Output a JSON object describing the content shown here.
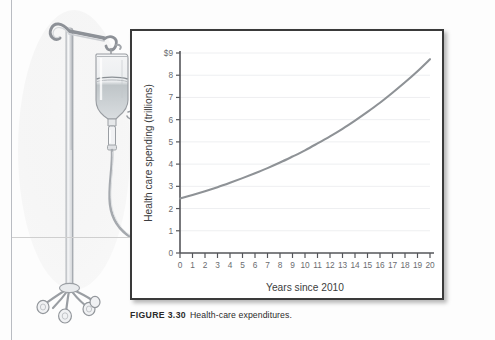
{
  "figure": {
    "caption_label": "FIGURE 3.30",
    "caption_text": "Health-care expenditures."
  },
  "illustration": {
    "name": "iv-drip-stand",
    "description": "Pencil sketch of a rolling IV stand with a fluid bag, drip chamber and tubing"
  },
  "chart_data": {
    "type": "line",
    "title": "",
    "subtitle": "",
    "xlabel": "Years since 2010",
    "ylabel": "Health care spending (trillions)",
    "xlim": [
      0,
      20
    ],
    "ylim": [
      0,
      9
    ],
    "grid": true,
    "legend": "none",
    "x_ticks": [
      "0",
      "1",
      "2",
      "3",
      "4",
      "5",
      "6",
      "7",
      "8",
      "9",
      "10",
      "11",
      "12",
      "13",
      "14",
      "15",
      "16",
      "17",
      "18",
      "19",
      "20"
    ],
    "y_ticks": [
      "0",
      "1",
      "2",
      "3",
      "4",
      "5",
      "6",
      "7",
      "8",
      "$9"
    ],
    "series": [
      {
        "name": "Health care spending",
        "color": "#8e9296",
        "x": [
          0,
          1,
          2,
          3,
          4,
          5,
          6,
          7,
          8,
          9,
          10,
          11,
          12,
          13,
          14,
          15,
          16,
          17,
          18,
          19,
          20
        ],
        "values": [
          2.45,
          2.61,
          2.78,
          2.96,
          3.16,
          3.37,
          3.59,
          3.82,
          4.07,
          4.34,
          4.62,
          4.93,
          5.25,
          5.59,
          5.96,
          6.35,
          6.76,
          7.21,
          7.68,
          8.18,
          8.72
        ]
      }
    ]
  },
  "colors": {
    "curve": "#8e9296",
    "axis": "#55565a",
    "grid": "#eeeff1",
    "panel_border": "#3a3a3a",
    "text": "#3c3d40"
  }
}
